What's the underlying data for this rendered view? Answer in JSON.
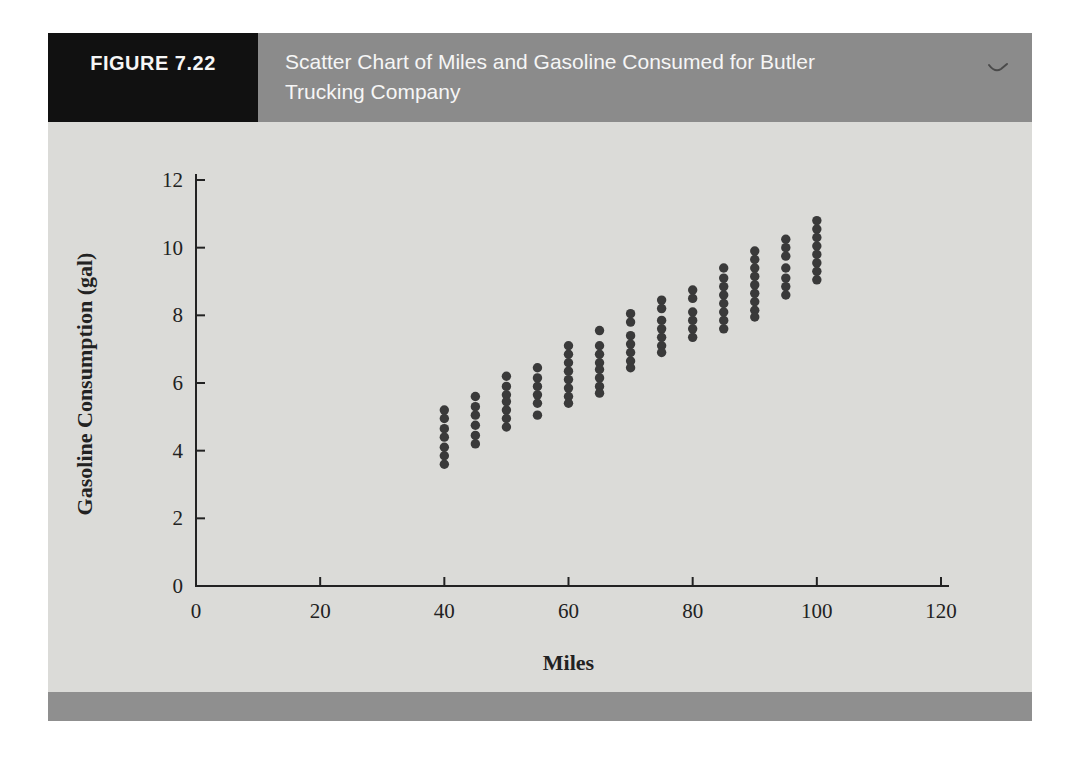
{
  "figure": {
    "label": "FIGURE 7.22",
    "title_lines": [
      "Scatter Chart of Miles and Gasoline Consumed for Butler",
      "Trucking Company"
    ]
  },
  "chart_data": {
    "type": "scatter",
    "xlabel": "Miles",
    "ylabel": "Gasoline Consumption (gal)",
    "xlim": [
      0,
      120
    ],
    "ylim": [
      0,
      12
    ],
    "xticks": [
      0,
      20,
      40,
      60,
      80,
      100,
      120
    ],
    "yticks": [
      0,
      2,
      4,
      6,
      8,
      10,
      12
    ],
    "grid": false,
    "legend": "none",
    "point_color": "#3a3a3a",
    "clusters": [
      {
        "miles": 40,
        "gallons": [
          5.2,
          4.95,
          4.65,
          4.4,
          4.1,
          3.85,
          3.6
        ]
      },
      {
        "miles": 45,
        "gallons": [
          5.6,
          5.3,
          5.05,
          4.75,
          4.45,
          4.2
        ]
      },
      {
        "miles": 50,
        "gallons": [
          6.2,
          5.9,
          5.65,
          5.45,
          5.2,
          4.95,
          4.7
        ]
      },
      {
        "miles": 55,
        "gallons": [
          6.45,
          6.15,
          5.9,
          5.65,
          5.4,
          5.05
        ]
      },
      {
        "miles": 60,
        "gallons": [
          7.1,
          6.85,
          6.6,
          6.35,
          6.1,
          5.85,
          5.6,
          5.4
        ]
      },
      {
        "miles": 65,
        "gallons": [
          7.55,
          7.1,
          6.85,
          6.6,
          6.4,
          6.15,
          5.9,
          5.7
        ]
      },
      {
        "miles": 70,
        "gallons": [
          8.05,
          7.8,
          7.4,
          7.15,
          6.9,
          6.65,
          6.45
        ]
      },
      {
        "miles": 75,
        "gallons": [
          8.45,
          8.2,
          7.85,
          7.6,
          7.35,
          7.1,
          6.9
        ]
      },
      {
        "miles": 80,
        "gallons": [
          8.75,
          8.5,
          8.1,
          7.85,
          7.6,
          7.35
        ]
      },
      {
        "miles": 85,
        "gallons": [
          9.4,
          9.1,
          8.85,
          8.6,
          8.35,
          8.1,
          7.85,
          7.6
        ]
      },
      {
        "miles": 90,
        "gallons": [
          9.9,
          9.65,
          9.4,
          9.15,
          8.9,
          8.65,
          8.4,
          8.15,
          7.95
        ]
      },
      {
        "miles": 95,
        "gallons": [
          10.25,
          10.0,
          9.75,
          9.4,
          9.1,
          8.85,
          8.6
        ]
      },
      {
        "miles": 100,
        "gallons": [
          10.8,
          10.55,
          10.3,
          10.05,
          9.8,
          9.55,
          9.3,
          9.05
        ]
      }
    ]
  },
  "colors": {
    "label_box": "#111111",
    "header_bar": "#8b8b8b",
    "body_bg": "#dbdbd8",
    "footer_bar": "#8f8f8f",
    "text_on_dark": "#f6f6f6",
    "chart_ink": "#222222",
    "pen_mark": "#4a4a4a"
  }
}
